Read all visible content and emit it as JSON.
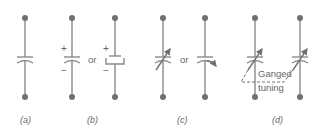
{
  "diagram": {
    "colors": {
      "stroke": "#8a8a8a",
      "node": "#707070",
      "text": "#666666"
    },
    "panels": [
      {
        "id": "a",
        "caption": "(a)",
        "description": "Fixed capacitor"
      },
      {
        "id": "b",
        "caption": "(b)",
        "description": "Polarized (electrolytic) capacitor",
        "plus": "+",
        "minus": "−",
        "or": "or"
      },
      {
        "id": "c",
        "caption": "(c)",
        "description": "Variable capacitor",
        "or": "or"
      },
      {
        "id": "d",
        "caption": "(d)",
        "description": "Ganged variable capacitors",
        "annotation_line1": "Ganged",
        "annotation_line2": "tuning"
      }
    ]
  }
}
